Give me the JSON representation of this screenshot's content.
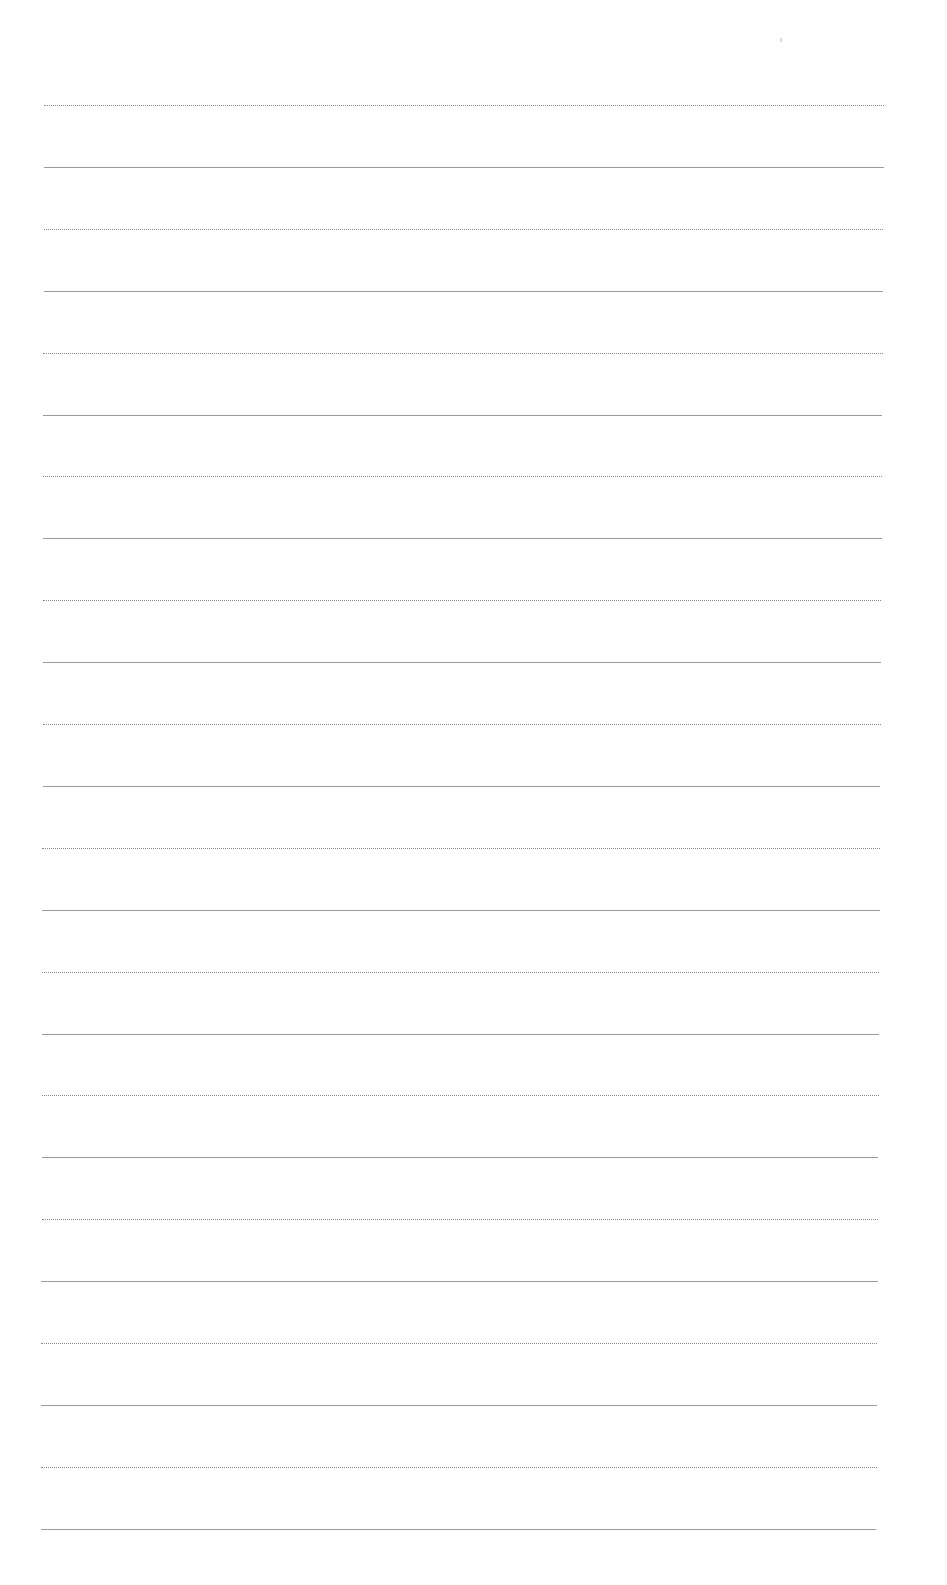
{
  "page": {
    "type": "lined-paper",
    "background": "#ffffff",
    "line_color": "#8a8a8a",
    "line_count": 24,
    "line_pattern": [
      "dotted",
      "solid"
    ],
    "first_line_y": 105,
    "line_spacing": 61.9,
    "line_left_x": 44,
    "line_right_x": 884
  }
}
